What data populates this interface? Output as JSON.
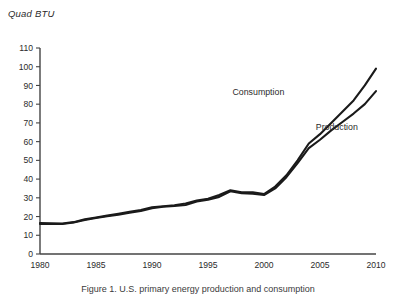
{
  "figure": {
    "axis_title": "Quad BTU",
    "caption": "Figure 1.  U.S. primary energy production and consumption"
  },
  "chart_data": {
    "type": "line",
    "title": "",
    "xlabel": "",
    "ylabel": "Quad BTU",
    "xlim": [
      1980,
      2010
    ],
    "ylim": [
      0,
      110
    ],
    "xticks": [
      1980,
      1985,
      1990,
      1995,
      2000,
      2005,
      2010
    ],
    "yticks": [
      0,
      10,
      20,
      30,
      40,
      50,
      60,
      70,
      80,
      90,
      100,
      110
    ],
    "grid": false,
    "legend_position": "inline-annotation",
    "line_color": "#1a1a1a",
    "axis_color": "#444444",
    "x": [
      1980,
      1981,
      1982,
      1983,
      1984,
      1985,
      1986,
      1987,
      1988,
      1989,
      1990,
      1991,
      1992,
      1993,
      1994,
      1995,
      1996,
      1997,
      1998,
      1999,
      2000,
      2001,
      2002,
      2003,
      2004,
      2005,
      2006,
      2007,
      2008,
      2009,
      2010
    ],
    "series": [
      {
        "name": "Consumption",
        "label": "Consumption",
        "label_x": 1999.5,
        "label_y": 85,
        "values": [
          16.5,
          16.4,
          16.3,
          17.0,
          18.5,
          19.5,
          20.5,
          21.5,
          22.5,
          23.5,
          25.0,
          25.5,
          26.0,
          27.0,
          28.5,
          29.5,
          31.5,
          34.0,
          33.0,
          33.0,
          32.0,
          36.0,
          42.0,
          50.0,
          59.0,
          64.0,
          70.0,
          76.0,
          82.0,
          90.0,
          99.0
        ]
      },
      {
        "name": "Production",
        "label": "Production",
        "label_x": 2006.5,
        "label_y": 66,
        "values": [
          16.0,
          16.0,
          16.0,
          16.8,
          18.2,
          19.2,
          20.2,
          21.0,
          22.0,
          23.0,
          24.5,
          25.2,
          25.6,
          26.2,
          28.0,
          29.0,
          30.5,
          33.5,
          32.5,
          32.2,
          31.5,
          35.0,
          41.0,
          48.5,
          56.5,
          61.0,
          66.0,
          70.5,
          75.0,
          80.0,
          87.0
        ]
      }
    ]
  }
}
